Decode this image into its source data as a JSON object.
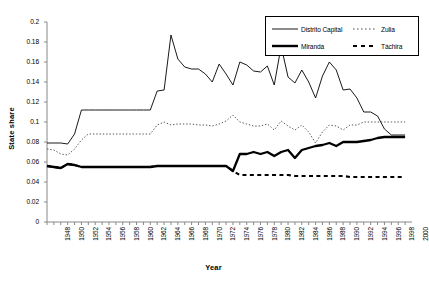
{
  "chart_data": {
    "type": "line",
    "title": "",
    "xlabel": "Year",
    "ylabel": "State share",
    "xlim": [
      1948,
      2001
    ],
    "ylim": [
      0,
      0.2
    ],
    "grid": false,
    "legend_position": "top-right",
    "y_ticks": [
      "0",
      "0.02",
      "0.04",
      "0.06",
      "0.08",
      "0.1",
      "0.12",
      "0.14",
      "0.16",
      "0.18",
      "0.2"
    ],
    "y_tick_values": [
      0,
      0.02,
      0.04,
      0.06,
      0.08,
      0.1,
      0.12,
      0.14,
      0.16,
      0.18,
      0.2
    ],
    "x_tick_labels": [
      "1948",
      "1950",
      "1952",
      "1954",
      "1956",
      "1958",
      "1960",
      "1962",
      "1964",
      "1966",
      "1968",
      "1970",
      "1972",
      "1974",
      "1976",
      "1978",
      "1980",
      "1982",
      "1984",
      "1986",
      "1988",
      "1990",
      "1992",
      "1994",
      "1996",
      "1998",
      "2000"
    ],
    "x_tick_values": [
      1948,
      1950,
      1952,
      1954,
      1956,
      1958,
      1960,
      1962,
      1964,
      1966,
      1968,
      1970,
      1972,
      1974,
      1976,
      1978,
      1980,
      1982,
      1984,
      1986,
      1988,
      1990,
      1992,
      1994,
      1996,
      1998,
      2000
    ],
    "x": [
      1948,
      1949,
      1950,
      1951,
      1952,
      1953,
      1954,
      1955,
      1956,
      1957,
      1958,
      1959,
      1960,
      1961,
      1962,
      1963,
      1964,
      1965,
      1966,
      1967,
      1968,
      1969,
      1970,
      1971,
      1972,
      1973,
      1974,
      1975,
      1976,
      1977,
      1978,
      1979,
      1980,
      1981,
      1982,
      1983,
      1984,
      1985,
      1986,
      1987,
      1988,
      1989,
      1990,
      1991,
      1992,
      1993,
      1994,
      1995,
      1996,
      1997,
      1998,
      1999,
      2000
    ],
    "series": [
      {
        "name": "Distrito Capital",
        "style": "solid-thin",
        "color": "#000000",
        "values": [
          0.079,
          0.079,
          0.079,
          0.078,
          0.088,
          0.112,
          0.112,
          0.112,
          0.112,
          0.112,
          0.112,
          0.112,
          0.112,
          0.112,
          0.112,
          0.112,
          0.131,
          0.132,
          0.187,
          0.163,
          0.155,
          0.153,
          0.153,
          0.148,
          0.14,
          0.158,
          0.148,
          0.137,
          0.16,
          0.157,
          0.151,
          0.15,
          0.156,
          0.137,
          0.176,
          0.145,
          0.139,
          0.152,
          0.14,
          0.124,
          0.146,
          0.16,
          0.152,
          0.132,
          0.133,
          0.124,
          0.11,
          0.11,
          0.106,
          0.093,
          0.087,
          0.087,
          0.087
        ]
      },
      {
        "name": "Zulia",
        "style": "dotted",
        "color": "#555555",
        "values": [
          0.073,
          0.072,
          0.068,
          0.067,
          0.073,
          0.082,
          0.088,
          0.088,
          0.088,
          0.088,
          0.088,
          0.088,
          0.088,
          0.088,
          0.088,
          0.088,
          0.097,
          0.1,
          0.097,
          0.098,
          0.098,
          0.098,
          0.097,
          0.097,
          0.096,
          0.098,
          0.101,
          0.107,
          0.1,
          0.098,
          0.096,
          0.096,
          0.098,
          0.092,
          0.101,
          0.096,
          0.092,
          0.097,
          0.09,
          0.079,
          0.09,
          0.097,
          0.096,
          0.092,
          0.097,
          0.097,
          0.1,
          0.1,
          0.1,
          0.1,
          0.1,
          0.1,
          0.1
        ]
      },
      {
        "name": "Miranda",
        "style": "solid-thick",
        "color": "#000000",
        "values": [
          0.056,
          0.055,
          0.054,
          0.058,
          0.057,
          0.055,
          0.055,
          0.055,
          0.055,
          0.055,
          0.055,
          0.055,
          0.055,
          0.055,
          0.055,
          0.055,
          0.056,
          0.056,
          0.056,
          0.056,
          0.056,
          0.056,
          0.056,
          0.056,
          0.056,
          0.056,
          0.056,
          0.051,
          0.068,
          0.068,
          0.07,
          0.068,
          0.07,
          0.066,
          0.07,
          0.072,
          0.064,
          0.072,
          0.074,
          0.076,
          0.077,
          0.079,
          0.076,
          0.08,
          0.08,
          0.08,
          0.081,
          0.082,
          0.084,
          0.085,
          0.085,
          0.085,
          0.085
        ]
      },
      {
        "name": "Táchira",
        "style": "dashed",
        "color": "#000000",
        "values": [
          0.056,
          0.055,
          0.054,
          0.058,
          0.057,
          0.055,
          0.055,
          0.055,
          0.055,
          0.055,
          0.055,
          0.055,
          0.055,
          0.055,
          0.055,
          0.055,
          0.056,
          0.056,
          0.056,
          0.056,
          0.056,
          0.056,
          0.056,
          0.056,
          0.056,
          0.056,
          0.056,
          0.051,
          0.047,
          0.047,
          0.047,
          0.047,
          0.047,
          0.047,
          0.047,
          0.047,
          0.046,
          0.046,
          0.046,
          0.046,
          0.046,
          0.046,
          0.046,
          0.046,
          0.045,
          0.045,
          0.045,
          0.045,
          0.045,
          0.045,
          0.045,
          0.045,
          0.045
        ]
      }
    ]
  }
}
